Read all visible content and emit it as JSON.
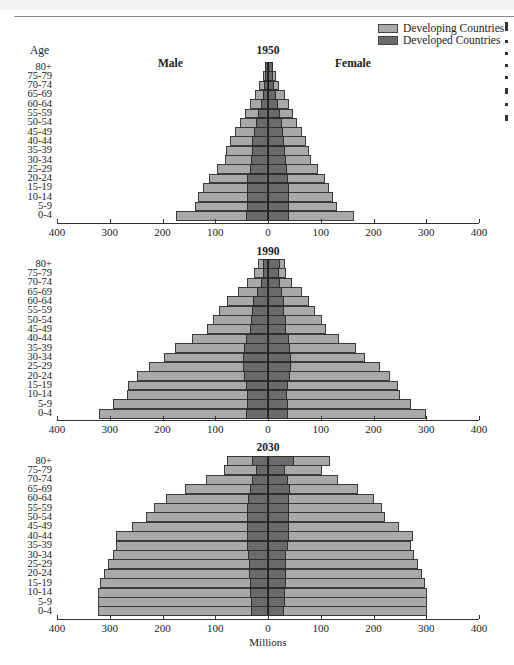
{
  "legend": {
    "items": [
      {
        "label": "Developing Countries",
        "color": "#a9a9a9"
      },
      {
        "label": "Developed Countries",
        "color": "#6a6a6a"
      }
    ]
  },
  "labels": {
    "age_header": "Age",
    "male": "Male",
    "female": "Female",
    "x_axis_title": "Millions"
  },
  "chart_data": [
    {
      "type": "bar",
      "subtype": "population-pyramid",
      "title": "1950",
      "xlabel": "Millions",
      "ylabel": "Age",
      "xlim": [
        -400,
        400
      ],
      "x_tick_labels": [
        "400",
        "300",
        "200",
        "100",
        "0",
        "100",
        "200",
        "300",
        "400"
      ],
      "categories": [
        "80+",
        "75-79",
        "70-74",
        "65-69",
        "60-64",
        "55-59",
        "50-54",
        "45-49",
        "40-44",
        "35-39",
        "30-34",
        "25-29",
        "20-24",
        "15-19",
        "10-14",
        "5-9",
        "0-4"
      ],
      "series": [
        {
          "name": "Male total (Developing + Developed)",
          "values": [
            6,
            9,
            17,
            25,
            34,
            44,
            53,
            63,
            72,
            80,
            82,
            96,
            112,
            123,
            132,
            138,
            174
          ]
        },
        {
          "name": "Male Developed Countries",
          "values": [
            6,
            6,
            8,
            10,
            14,
            19,
            23,
            26,
            30,
            30,
            32,
            35,
            40,
            40,
            40,
            40,
            42
          ]
        },
        {
          "name": "Female total (Developing + Developed)",
          "values": [
            9,
            15,
            21,
            32,
            40,
            47,
            55,
            64,
            72,
            78,
            82,
            94,
            108,
            115,
            124,
            130,
            163
          ]
        },
        {
          "name": "Female Developed Countries",
          "values": [
            9,
            9,
            12,
            15,
            19,
            23,
            26,
            28,
            30,
            32,
            34,
            36,
            38,
            40,
            40,
            40,
            40
          ]
        }
      ]
    },
    {
      "type": "bar",
      "subtype": "population-pyramid",
      "title": "1990",
      "xlabel": "Millions",
      "ylabel": "Age",
      "xlim": [
        -400,
        400
      ],
      "x_tick_labels": [
        "400",
        "300",
        "200",
        "100",
        "0",
        "100",
        "200",
        "300",
        "400"
      ],
      "categories": [
        "80+",
        "75-79",
        "70-74",
        "65-69",
        "60-64",
        "55-59",
        "50-54",
        "45-49",
        "40-44",
        "35-39",
        "30-34",
        "25-29",
        "20-24",
        "15-19",
        "10-14",
        "5-9",
        "0-4"
      ],
      "series": [
        {
          "name": "Male total (Developing + Developed)",
          "values": [
            19,
            27,
            40,
            56,
            78,
            92,
            105,
            115,
            145,
            177,
            197,
            225,
            249,
            266,
            267,
            293,
            320
          ]
        },
        {
          "name": "Male Developed Countries",
          "values": [
            10,
            10,
            14,
            20,
            28,
            30,
            32,
            34,
            42,
            46,
            47,
            47,
            45,
            41,
            40,
            40,
            41
          ]
        },
        {
          "name": "Female total (Developing + Developed)",
          "values": [
            32,
            34,
            45,
            64,
            78,
            89,
            103,
            110,
            135,
            167,
            183,
            212,
            232,
            246,
            250,
            272,
            300
          ]
        },
        {
          "name": "Female Developed Countries",
          "values": [
            22,
            20,
            22,
            26,
            30,
            30,
            34,
            34,
            40,
            42,
            43,
            43,
            42,
            37,
            36,
            38,
            38
          ]
        }
      ]
    },
    {
      "type": "bar",
      "subtype": "population-pyramid",
      "title": "2030",
      "xlabel": "Millions",
      "ylabel": "Age",
      "xlim": [
        -400,
        400
      ],
      "x_tick_labels": [
        "400",
        "300",
        "200",
        "100",
        "0",
        "100",
        "200",
        "300",
        "400"
      ],
      "categories": [
        "80+",
        "75-79",
        "70-74",
        "65-69",
        "60-64",
        "55-59",
        "50-54",
        "45-49",
        "40-44",
        "35-39",
        "30-34",
        "25-29",
        "20-24",
        "15-19",
        "10-14",
        "5-9",
        "0-4"
      ],
      "series": [
        {
          "name": "Male total (Developing + Developed)",
          "values": [
            77,
            83,
            117,
            157,
            193,
            217,
            232,
            258,
            288,
            288,
            294,
            303,
            310,
            318,
            322,
            322,
            323
          ]
        },
        {
          "name": "Male Developed Countries",
          "values": [
            30,
            23,
            30,
            35,
            38,
            40,
            39,
            40,
            40,
            39,
            37,
            36,
            36,
            35,
            35,
            33,
            32
          ]
        },
        {
          "name": "Female total (Developing + Developed)",
          "values": [
            117,
            102,
            133,
            170,
            200,
            216,
            222,
            248,
            274,
            272,
            276,
            285,
            292,
            298,
            301,
            301,
            302
          ]
        },
        {
          "name": "Female Developed Countries",
          "values": [
            50,
            32,
            38,
            42,
            40,
            40,
            40,
            40,
            40,
            38,
            35,
            35,
            35,
            34,
            33,
            32,
            31
          ]
        }
      ]
    }
  ]
}
